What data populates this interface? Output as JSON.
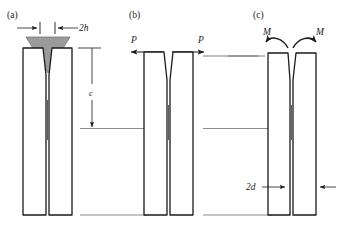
{
  "figure": {
    "background_color": "#ffffff",
    "line_color": "#1a1a1a",
    "wedge_fill_color": "#9a9a9a",
    "faint_line_color": "#6e6e6e"
  },
  "panels": [
    {
      "id": "a",
      "label": "(a)",
      "loading": "wedge",
      "annotations": [
        {
          "name": "wedge-width",
          "text": "2h",
          "kind": "dimension-horizontal"
        },
        {
          "name": "crack-length",
          "text": "c",
          "kind": "dimension-vertical"
        }
      ]
    },
    {
      "id": "b",
      "label": "(b)",
      "loading": "opposed-forces",
      "annotations": [
        {
          "name": "force-left",
          "text": "P",
          "kind": "force-arrow-left"
        },
        {
          "name": "force-right",
          "text": "P",
          "kind": "force-arrow-right"
        }
      ]
    },
    {
      "id": "c",
      "label": "(c)",
      "loading": "opposed-moments",
      "annotations": [
        {
          "name": "moment-left",
          "text": "M",
          "kind": "moment-arrow-left"
        },
        {
          "name": "moment-right",
          "text": "M",
          "kind": "moment-arrow-right"
        },
        {
          "name": "beam-thickness",
          "text": "2d",
          "kind": "dimension-horizontal"
        }
      ]
    }
  ],
  "labels": {
    "panel_a": "(a)",
    "panel_b": "(b)",
    "panel_c": "(c)",
    "wedge_width": "2h",
    "crack_length": "c",
    "force_left": "P",
    "force_right": "P",
    "moment_left": "M",
    "moment_right": "M",
    "beam_thickness": "2d"
  }
}
